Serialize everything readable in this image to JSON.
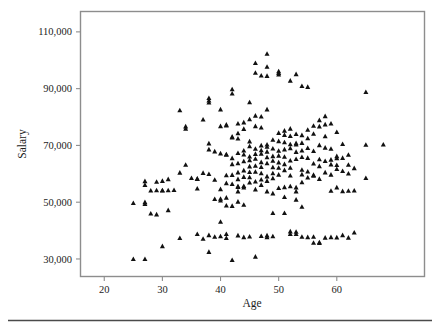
{
  "figure": {
    "background_color": "#ffffff",
    "frame_color": "#8d8d8d",
    "marker_color": "#111111",
    "footer_rule_color": "#4a4a4a"
  },
  "chart_data": {
    "type": "scatter",
    "title": "",
    "xlabel": "Age",
    "ylabel": "Salary",
    "xlim": [
      16,
      75
    ],
    "ylim": [
      24000,
      117000
    ],
    "xticks": [
      20,
      30,
      40,
      50,
      60
    ],
    "xtick_labels": [
      "20",
      "30",
      "40",
      "50",
      "60"
    ],
    "yticks": [
      30000,
      50000,
      70000,
      90000,
      110000
    ],
    "ytick_labels": [
      "30,000",
      "50,000",
      "70,000",
      "90,000",
      "110,000"
    ],
    "grid": false,
    "legend": false,
    "marker": "triangle-up",
    "marker_size": 5,
    "series": [
      {
        "name": "Employees",
        "points": [
          [
            25,
            49800
          ],
          [
            25,
            30100
          ],
          [
            27,
            57500
          ],
          [
            27,
            56200
          ],
          [
            27,
            50100
          ],
          [
            27,
            49500
          ],
          [
            27,
            30100
          ],
          [
            28,
            54200
          ],
          [
            28,
            46100
          ],
          [
            29,
            54300
          ],
          [
            29,
            45800
          ],
          [
            29,
            57300
          ],
          [
            30,
            54200
          ],
          [
            30,
            57600
          ],
          [
            30,
            34600
          ],
          [
            30,
            54300
          ],
          [
            31,
            54300
          ],
          [
            31,
            58200
          ],
          [
            31,
            47300
          ],
          [
            32,
            54400
          ],
          [
            33,
            82500
          ],
          [
            33,
            60500
          ],
          [
            33,
            37500
          ],
          [
            34,
            76800
          ],
          [
            34,
            63300
          ],
          [
            34,
            76000
          ],
          [
            35,
            58600
          ],
          [
            36,
            58400
          ],
          [
            36,
            54900
          ],
          [
            36,
            38900
          ],
          [
            36,
            58300
          ],
          [
            37,
            79200
          ],
          [
            37,
            60400
          ],
          [
            37,
            37200
          ],
          [
            38,
            86800
          ],
          [
            38,
            85900
          ],
          [
            38,
            85200
          ],
          [
            38,
            70800
          ],
          [
            38,
            68700
          ],
          [
            38,
            60000
          ],
          [
            38,
            38500
          ],
          [
            38,
            32600
          ],
          [
            39,
            68000
          ],
          [
            39,
            58000
          ],
          [
            39,
            51200
          ],
          [
            39,
            37900
          ],
          [
            40,
            82800
          ],
          [
            40,
            76900
          ],
          [
            40,
            67300
          ],
          [
            40,
            54700
          ],
          [
            40,
            51300
          ],
          [
            40,
            50700
          ],
          [
            40,
            43200
          ],
          [
            40,
            38100
          ],
          [
            41,
            77100
          ],
          [
            41,
            77400
          ],
          [
            41,
            67000
          ],
          [
            41,
            66800
          ],
          [
            41,
            59600
          ],
          [
            41,
            56800
          ],
          [
            41,
            51700
          ],
          [
            41,
            48900
          ],
          [
            41,
            38900
          ],
          [
            41,
            37500
          ],
          [
            42,
            89900
          ],
          [
            42,
            88400
          ],
          [
            42,
            73200
          ],
          [
            42,
            72900
          ],
          [
            42,
            65600
          ],
          [
            42,
            63500
          ],
          [
            42,
            59700
          ],
          [
            42,
            56500
          ],
          [
            42,
            48800
          ],
          [
            42,
            29700
          ],
          [
            43,
            77800
          ],
          [
            43,
            74400
          ],
          [
            43,
            72500
          ],
          [
            43,
            67400
          ],
          [
            43,
            63800
          ],
          [
            43,
            60600
          ],
          [
            43,
            58200
          ],
          [
            43,
            55700
          ],
          [
            43,
            55500
          ],
          [
            43,
            53900
          ],
          [
            43,
            50300
          ],
          [
            43,
            38400
          ],
          [
            44,
            78200
          ],
          [
            44,
            75900
          ],
          [
            44,
            68300
          ],
          [
            44,
            66900
          ],
          [
            44,
            64500
          ],
          [
            44,
            61300
          ],
          [
            44,
            59000
          ],
          [
            44,
            55800
          ],
          [
            44,
            55300
          ],
          [
            44,
            49200
          ],
          [
            44,
            37800
          ],
          [
            45,
            85300
          ],
          [
            45,
            79300
          ],
          [
            45,
            71500
          ],
          [
            45,
            69800
          ],
          [
            45,
            66200
          ],
          [
            45,
            64900
          ],
          [
            45,
            62700
          ],
          [
            45,
            60700
          ],
          [
            45,
            58900
          ],
          [
            45,
            57000
          ],
          [
            45,
            38000
          ],
          [
            46,
            99100
          ],
          [
            46,
            95700
          ],
          [
            46,
            80600
          ],
          [
            46,
            76900
          ],
          [
            46,
            68900
          ],
          [
            46,
            67100
          ],
          [
            46,
            65400
          ],
          [
            46,
            62900
          ],
          [
            46,
            60800
          ],
          [
            46,
            57400
          ],
          [
            46,
            54600
          ],
          [
            46,
            30900
          ],
          [
            47,
            94700
          ],
          [
            47,
            80300
          ],
          [
            47,
            76400
          ],
          [
            47,
            70100
          ],
          [
            47,
            68400
          ],
          [
            47,
            67200
          ],
          [
            47,
            64200
          ],
          [
            47,
            62500
          ],
          [
            47,
            60300
          ],
          [
            47,
            58100
          ],
          [
            47,
            56200
          ],
          [
            47,
            38200
          ],
          [
            48,
            102400
          ],
          [
            48,
            97800
          ],
          [
            48,
            94600
          ],
          [
            48,
            82800
          ],
          [
            48,
            70400
          ],
          [
            48,
            69600
          ],
          [
            48,
            67900
          ],
          [
            48,
            65900
          ],
          [
            48,
            63800
          ],
          [
            48,
            59200
          ],
          [
            48,
            57600
          ],
          [
            48,
            53900
          ],
          [
            48,
            38400
          ],
          [
            48,
            37800
          ],
          [
            49,
            72100
          ],
          [
            49,
            69000
          ],
          [
            49,
            66300
          ],
          [
            49,
            64700
          ],
          [
            49,
            62400
          ],
          [
            49,
            60300
          ],
          [
            49,
            58500
          ],
          [
            49,
            53200
          ],
          [
            49,
            46300
          ],
          [
            49,
            38100
          ],
          [
            50,
            96200
          ],
          [
            50,
            95600
          ],
          [
            50,
            95100
          ],
          [
            50,
            74500
          ],
          [
            50,
            71600
          ],
          [
            50,
            68200
          ],
          [
            50,
            66500
          ],
          [
            50,
            64100
          ],
          [
            50,
            62200
          ],
          [
            50,
            59800
          ],
          [
            50,
            55100
          ],
          [
            51,
            75300
          ],
          [
            51,
            73800
          ],
          [
            51,
            71200
          ],
          [
            51,
            68700
          ],
          [
            51,
            66100
          ],
          [
            51,
            63500
          ],
          [
            51,
            61400
          ],
          [
            51,
            55400
          ],
          [
            51,
            51900
          ],
          [
            51,
            46300
          ],
          [
            52,
            92900
          ],
          [
            52,
            76000
          ],
          [
            52,
            73400
          ],
          [
            52,
            70500
          ],
          [
            52,
            69100
          ],
          [
            52,
            64800
          ],
          [
            52,
            62200
          ],
          [
            52,
            59500
          ],
          [
            52,
            55700
          ],
          [
            52,
            39800
          ],
          [
            52,
            38900
          ],
          [
            53,
            95200
          ],
          [
            53,
            74100
          ],
          [
            53,
            70900
          ],
          [
            53,
            70400
          ],
          [
            53,
            67800
          ],
          [
            53,
            65300
          ],
          [
            53,
            55300
          ],
          [
            53,
            53900
          ],
          [
            53,
            51000
          ],
          [
            53,
            39700
          ],
          [
            53,
            38900
          ],
          [
            54,
            91000
          ],
          [
            54,
            73700
          ],
          [
            54,
            71000
          ],
          [
            54,
            68300
          ],
          [
            54,
            66000
          ],
          [
            54,
            61500
          ],
          [
            54,
            59900
          ],
          [
            54,
            57100
          ],
          [
            54,
            48500
          ],
          [
            54,
            37900
          ],
          [
            55,
            90700
          ],
          [
            55,
            75600
          ],
          [
            55,
            72600
          ],
          [
            55,
            69200
          ],
          [
            55,
            65700
          ],
          [
            55,
            60900
          ],
          [
            55,
            58800
          ],
          [
            55,
            37800
          ],
          [
            56,
            77000
          ],
          [
            56,
            74200
          ],
          [
            56,
            68100
          ],
          [
            56,
            63700
          ],
          [
            56,
            59700
          ],
          [
            56,
            59400
          ],
          [
            56,
            37900
          ],
          [
            56,
            35800
          ],
          [
            57,
            79000
          ],
          [
            57,
            76800
          ],
          [
            57,
            70200
          ],
          [
            57,
            65200
          ],
          [
            57,
            62800
          ],
          [
            57,
            58300
          ],
          [
            57,
            36000
          ],
          [
            57,
            35700
          ],
          [
            58,
            80400
          ],
          [
            58,
            77500
          ],
          [
            58,
            73300
          ],
          [
            58,
            69300
          ],
          [
            58,
            64600
          ],
          [
            58,
            60600
          ],
          [
            58,
            37600
          ],
          [
            59,
            77800
          ],
          [
            59,
            68900
          ],
          [
            59,
            65100
          ],
          [
            59,
            63400
          ],
          [
            59,
            59800
          ],
          [
            59,
            54100
          ],
          [
            59,
            37800
          ],
          [
            60,
            74800
          ],
          [
            60,
            66300
          ],
          [
            60,
            65600
          ],
          [
            60,
            63200
          ],
          [
            60,
            61800
          ],
          [
            60,
            55300
          ],
          [
            60,
            37700
          ],
          [
            61,
            70600
          ],
          [
            61,
            65700
          ],
          [
            61,
            61100
          ],
          [
            61,
            54000
          ],
          [
            61,
            38500
          ],
          [
            62,
            66800
          ],
          [
            62,
            63300
          ],
          [
            62,
            60200
          ],
          [
            62,
            54100
          ],
          [
            62,
            37600
          ],
          [
            63,
            62100
          ],
          [
            63,
            54200
          ],
          [
            63,
            39400
          ],
          [
            65,
            88900
          ],
          [
            65,
            70300
          ],
          [
            65,
            58600
          ],
          [
            68,
            70400
          ]
        ]
      }
    ]
  },
  "axes": {
    "x_title": "Age",
    "y_title": "Salary"
  }
}
